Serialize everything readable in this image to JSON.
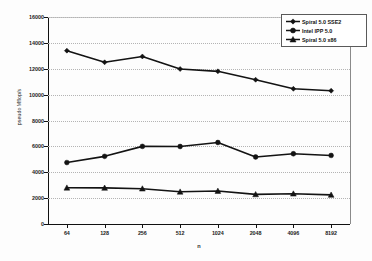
{
  "chart_data": {
    "type": "line",
    "title": "",
    "xlabel": "n",
    "ylabel": "pseudo Mflop/s",
    "categories": [
      "64",
      "128",
      "256",
      "512",
      "1024",
      "2048",
      "4096",
      "8192"
    ],
    "ylim": [
      0,
      16000
    ],
    "ytick_step": 2000,
    "yticks": [
      "0",
      "2000",
      "4000",
      "6000",
      "8000",
      "10000",
      "12000",
      "14000",
      "16000"
    ],
    "grid": true,
    "grid_axis": "y",
    "legend_position": "top-right",
    "series": [
      {
        "name": "Spiral 5.0 SSE2",
        "marker": "diamond",
        "color": "#131313",
        "values": [
          13400,
          12500,
          12950,
          11980,
          11800,
          11150,
          10450,
          10300
        ]
      },
      {
        "name": "Intel IPP 5.0",
        "marker": "circle",
        "color": "#131313",
        "values": [
          4750,
          5230,
          6000,
          5990,
          6300,
          5180,
          5430,
          5300
        ]
      },
      {
        "name": "Spiral 5.0 x86",
        "marker": "triangle",
        "color": "#131313",
        "values": [
          2800,
          2790,
          2730,
          2490,
          2550,
          2290,
          2340,
          2250
        ]
      }
    ]
  },
  "legend": {
    "entries": [
      {
        "label": "Spiral 5.0 SSE2"
      },
      {
        "label": "Intel IPP 5.0"
      },
      {
        "label": "Spiral 5.0 x86"
      }
    ]
  }
}
